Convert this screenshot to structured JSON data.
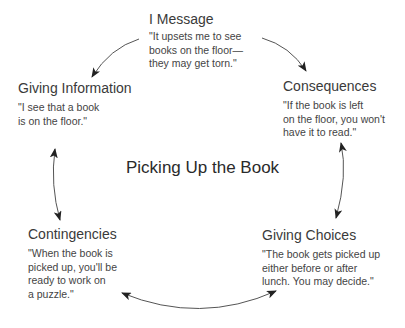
{
  "diagram": {
    "center_title": "Picking Up the Book",
    "nodes": [
      {
        "id": "i-message",
        "title": "I Message",
        "quote": "\"It upsets me to see\nbooks on the floor—\nthey may get torn.\""
      },
      {
        "id": "consequences",
        "title": "Consequences",
        "quote": "\"If the book is left\non the floor, you won't\nhave it to read.\""
      },
      {
        "id": "giving-choices",
        "title": "Giving Choices",
        "quote": "\"The book gets picked up\neither before or after\nlunch. You may decide.\""
      },
      {
        "id": "contingencies",
        "title": "Contingencies",
        "quote": "\"When the book is\npicked up, you'll be\nready to work on\na puzzle.\""
      },
      {
        "id": "giving-information",
        "title": "Giving Information",
        "quote": "\"I see that a book\nis on the floor.\""
      }
    ],
    "arrows": [
      {
        "from": "i-message",
        "to": "giving-information",
        "type": "single"
      },
      {
        "from": "i-message",
        "to": "consequences",
        "type": "single"
      },
      {
        "from": "consequences",
        "to": "giving-choices",
        "type": "double"
      },
      {
        "from": "giving-choices",
        "to": "contingencies",
        "type": "double"
      },
      {
        "from": "contingencies",
        "to": "giving-information",
        "type": "double"
      }
    ],
    "colors": {
      "text": "#333333",
      "arrow": "#222222",
      "background": "#ffffff"
    }
  }
}
